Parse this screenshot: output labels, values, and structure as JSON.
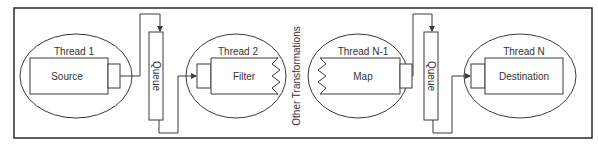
{
  "diagram": {
    "type": "pipeline",
    "colors": {
      "line": "#3a3a3a",
      "text": "#333333",
      "background": "#ffffff"
    },
    "threads": [
      {
        "label": "Thread 1",
        "stage": "Source"
      },
      {
        "label": "Thread 2",
        "stage": "Filter"
      },
      {
        "label": "Thread N-1",
        "stage": "Map"
      },
      {
        "label": "Thread N",
        "stage": "Destination"
      }
    ],
    "queues": [
      {
        "label": "Queue"
      },
      {
        "label": "Queue"
      }
    ],
    "middle_label": "Other Transformations"
  }
}
